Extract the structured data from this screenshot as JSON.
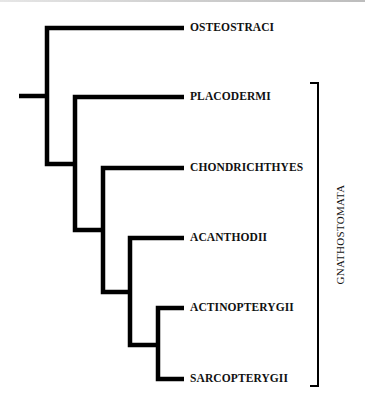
{
  "diagram": {
    "type": "cladogram",
    "line_color": "#000000",
    "taxa": [
      {
        "id": "osteostraci",
        "label": "OSTEOSTRACI"
      },
      {
        "id": "placodermi",
        "label": "PLACODERMI"
      },
      {
        "id": "chondrichthyes",
        "label": "CHONDRICHTHYES"
      },
      {
        "id": "acanthodii",
        "label": "ACANTHODII"
      },
      {
        "id": "actinopterygii",
        "label": "ACTINOPTERYGII"
      },
      {
        "id": "sarcopterygii",
        "label": "SARCOPTERYGII"
      }
    ],
    "topology": "(OSTEOSTRACI,(PLACODERMI,(CHONDRICHTHYES,(ACANTHODII,(ACTINOPTERYGII,SARCOPTERYGII)))))",
    "clade_bracket": {
      "label": "GNATHOSTOMATA",
      "spans": [
        "PLACODERMI",
        "CHONDRICHTHYES",
        "ACANTHODII",
        "ACTINOPTERYGII",
        "SARCOPTERYGII"
      ]
    }
  }
}
